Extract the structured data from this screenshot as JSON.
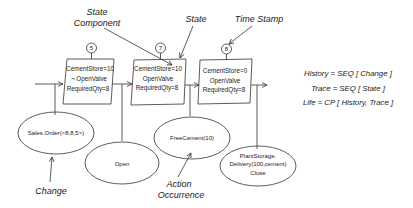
{
  "annotations": {
    "state_component": [
      "State",
      "Component"
    ],
    "state": "State",
    "time_stamp": "Time Stamp",
    "change": "Change",
    "action_occurrence": [
      "Action",
      "Occurrence"
    ]
  },
  "states": [
    {
      "timestamp": "5",
      "lines": [
        "CementStore=10",
        "¬ OpenValve",
        "RequiredQty=8"
      ]
    },
    {
      "timestamp": "7",
      "lines": [
        "CementStore=10",
        "OpenValve",
        "RequiredQty=8"
      ]
    },
    {
      "timestamp": "8",
      "lines": [
        "CementStore=0",
        "OpenValve",
        "RequiredQty=8"
      ]
    }
  ],
  "changes": [
    {
      "lines": [
        "Sales.Order(<8,8,5>)"
      ]
    },
    {
      "lines": [
        "Open"
      ]
    },
    {
      "lines": [
        "FreeCement(10)"
      ]
    },
    {
      "lines": [
        "PlantStorage.",
        "Delivery(100,cement)",
        "Close"
      ]
    }
  ],
  "formulas": [
    "History  =  SEQ [ Change ]",
    "Trace  =  SEQ [ State ]",
    "Life  =  CP [ History, Trace ]"
  ]
}
